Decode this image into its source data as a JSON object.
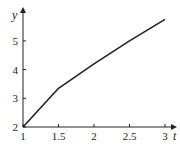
{
  "chart_data": {
    "type": "line",
    "title": "",
    "xlabel": "t",
    "ylabel": "y",
    "xlim": [
      1,
      3
    ],
    "ylim": [
      2,
      6
    ],
    "grid": false,
    "legend": null,
    "xticks": [
      "1",
      "1.5",
      "2",
      "2.5",
      "3"
    ],
    "yticks": [
      "2",
      "3",
      "4",
      "5"
    ],
    "series": [
      {
        "name": "y(t)",
        "color": "#222222",
        "x": [
          1,
          1.5,
          2,
          2.5,
          3
        ],
        "values": [
          2,
          3.35,
          4.2,
          5.0,
          5.75
        ]
      }
    ]
  }
}
